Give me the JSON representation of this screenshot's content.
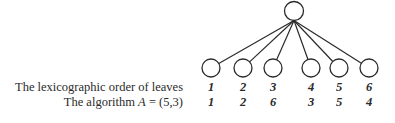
{
  "diagram": {
    "root": {
      "cx": 294,
      "cy": 11,
      "r": 9.5
    },
    "leaves": [
      {
        "cx": 211,
        "cy": 68,
        "r": 9
      },
      {
        "cx": 243,
        "cy": 68,
        "r": 9
      },
      {
        "cx": 273,
        "cy": 68,
        "r": 9
      },
      {
        "cx": 311,
        "cy": 68,
        "r": 9
      },
      {
        "cx": 339,
        "cy": 68,
        "r": 9
      },
      {
        "cx": 369,
        "cy": 68,
        "r": 9
      }
    ],
    "stroke_color": "#2a2a2a"
  },
  "rows": [
    {
      "label": "The lexicographic order of leaves",
      "values": [
        "1",
        "2",
        "3",
        "4",
        "5",
        "6"
      ]
    },
    {
      "label_prefix": "The algorithm ",
      "label_var": "A",
      "label_suffix": " = (5,3)",
      "values": [
        "1",
        "2",
        "6",
        "3",
        "5",
        "4"
      ]
    }
  ]
}
